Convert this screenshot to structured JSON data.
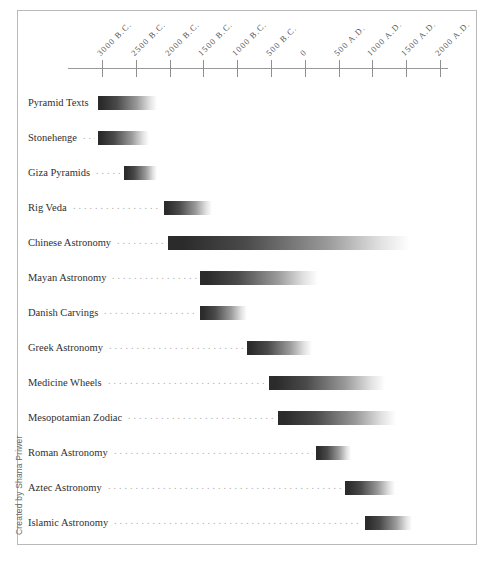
{
  "credit": {
    "text": "Created by Shana Priwer"
  },
  "chart_data": {
    "type": "bar",
    "orientation": "horizontal",
    "title": "",
    "subtitle": "",
    "xlabel": "",
    "ylabel": "",
    "grid": false,
    "legend": null,
    "xlim": [
      -3500,
      2300
    ],
    "axis_ticks": [
      {
        "label": "3000 B.C.",
        "value": -3000
      },
      {
        "label": "2500 B.C.",
        "value": -2500
      },
      {
        "label": "2000 B.C.",
        "value": -2000
      },
      {
        "label": "1500 B.C.",
        "value": -1500
      },
      {
        "label": "1000 B.C.",
        "value": -1000
      },
      {
        "label": "500 B.C.",
        "value": -500
      },
      {
        "label": "0",
        "value": 0
      },
      {
        "label": "500 A.D.",
        "value": 500
      },
      {
        "label": "1000 A.D.",
        "value": 1000
      },
      {
        "label": "1500 A.D.",
        "value": 1500
      },
      {
        "label": "2000 A.D.",
        "value": 2000
      }
    ],
    "categories": [
      "Pyramid Texts",
      "Stonehenge",
      "Giza Pyramids",
      "Rig Veda",
      "Chinese Astronomy",
      "Mayan Astronomy",
      "Danish Carvings",
      "Greek Astronomy",
      "Medicine Wheels",
      "Mesopotamian Zodiac",
      "Roman Astronomy",
      "Aztec Astronomy",
      "Islamic Astronomy"
    ],
    "bars": [
      {
        "label": "Pyramid Texts",
        "start": -3060,
        "end": -2180
      },
      {
        "label": "Stonehenge",
        "start": -3060,
        "end": -2300
      },
      {
        "label": "Giza Pyramids",
        "start": -2680,
        "end": -2180
      },
      {
        "label": "Rig Veda",
        "start": -2090,
        "end": -1380
      },
      {
        "label": "Chinese Astronomy",
        "start": -2030,
        "end": 1560
      },
      {
        "label": "Mayan Astronomy",
        "start": -1550,
        "end": 200
      },
      {
        "label": "Danish Carvings",
        "start": -1550,
        "end": -860
      },
      {
        "label": "Greek Astronomy",
        "start": -860,
        "end": 100
      },
      {
        "label": "Medicine Wheels",
        "start": -530,
        "end": 1180
      },
      {
        "label": "Mesopotamian Zodiac",
        "start": -400,
        "end": 1350
      },
      {
        "label": "Roman Astronomy",
        "start": 170,
        "end": 690
      },
      {
        "label": "Aztec Astronomy",
        "start": 590,
        "end": 1330
      },
      {
        "label": "Islamic Astronomy",
        "start": 890,
        "end": 1590
      }
    ]
  },
  "colors": {
    "bar_dark": "#2b2b2b",
    "bar_light": "#ffffff",
    "axis": "#9a9a9a",
    "frame": "#b9b9b9",
    "label_text": "#2f2f2f",
    "tick_text": "#555555",
    "leader": "#a9a9a9",
    "credit_text": "#6d6d6d"
  }
}
